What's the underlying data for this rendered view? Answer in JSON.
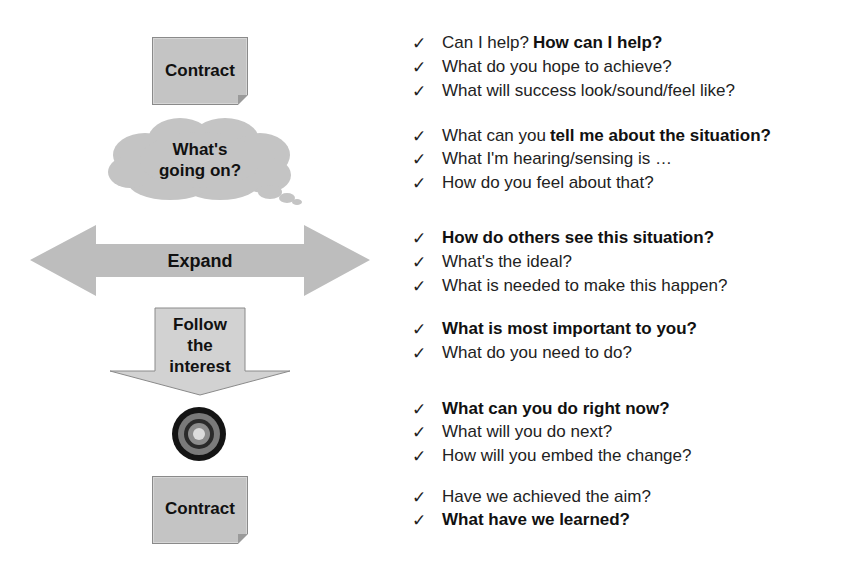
{
  "colors": {
    "shape_fill": "#c4c4c4",
    "shape_border": "#8a8a8a",
    "arrow_down_fill": "#d2d2d2",
    "target_rings": [
      "#141414",
      "#7a7a7a",
      "#2a2a2a",
      "#8c8c8c",
      "#dcdcdc"
    ],
    "text": "#222222"
  },
  "flow": {
    "contract_top": {
      "label": "Contract"
    },
    "cloud": {
      "line1": "What's",
      "line2": "going on?"
    },
    "expand_arrow": {
      "label": "Expand"
    },
    "follow_arrow": {
      "line1": "Follow",
      "line2": "the",
      "line3": "interest"
    },
    "target": {
      "icon": "target-icon"
    },
    "contract_bottom": {
      "label": "Contract"
    }
  },
  "checklist": {
    "check_glyph": "✓",
    "groups": [
      {
        "items": [
          {
            "plain": "Can I help? ",
            "bold": "How can I help?"
          },
          {
            "plain": "What do you hope to achieve?",
            "bold": ""
          },
          {
            "plain": "What will success look/sound/feel like?",
            "bold": ""
          }
        ]
      },
      {
        "items": [
          {
            "plain": "What can you ",
            "bold": "tell me about the situation?"
          },
          {
            "plain": "What I'm hearing/sensing is …",
            "bold": ""
          },
          {
            "plain": "How do you feel about that?",
            "bold": ""
          }
        ]
      },
      {
        "items": [
          {
            "plain": "",
            "bold": "How do others see this situation?"
          },
          {
            "plain": "What's the ideal?",
            "bold": ""
          },
          {
            "plain": "What is needed to make this happen?",
            "bold": ""
          }
        ]
      },
      {
        "items": [
          {
            "plain": "",
            "bold": "What is most important to you?"
          },
          {
            "plain": "What do you need to do?",
            "bold": ""
          }
        ]
      },
      {
        "items": [
          {
            "plain": "",
            "bold": "What can you do right now?"
          },
          {
            "plain": "What will you do next?",
            "bold": ""
          },
          {
            "plain": "How will you embed the change?",
            "bold": ""
          }
        ]
      },
      {
        "items": [
          {
            "plain": "Have we achieved the aim?",
            "bold": ""
          },
          {
            "plain": "",
            "bold": "What have we learned?"
          }
        ]
      }
    ]
  }
}
